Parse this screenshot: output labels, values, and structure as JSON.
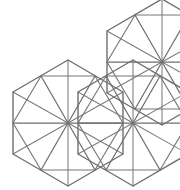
{
  "figure": {
    "type": "geometric-line-diagram",
    "canvas": {
      "width": 180,
      "height": 190,
      "background": "#ffffff"
    },
    "stroke_colors": {
      "outline": "#6f6f6f",
      "inner_ring": "#777777",
      "spoke": "#6f6f6f",
      "diagonal": "#7c7c7c"
    },
    "geometry": {
      "cell_shape": "hexagon",
      "cell_circumradius": 63,
      "hub_spokes": 12,
      "orientation": "pointy-top",
      "cells": [
        {
          "name": "cell-lower-left",
          "hub": [
            68,
            123
          ],
          "clipped": false
        },
        {
          "name": "cell-middle",
          "hub": [
            133,
            123
          ],
          "clipped": true
        },
        {
          "name": "cell-upper-right",
          "hub": [
            162,
            62
          ],
          "clipped": true
        }
      ],
      "cell_outline_vertices": [
        [
          0,
          -63
        ],
        [
          55,
          -31
        ],
        [
          55,
          31
        ],
        [
          0,
          63
        ],
        [
          -55,
          31
        ],
        [
          -55,
          -31
        ]
      ],
      "inner_ring_vertices": [
        [
          27,
          -47
        ],
        [
          55,
          0
        ],
        [
          27,
          47
        ],
        [
          -27,
          47
        ],
        [
          -55,
          0
        ],
        [
          -27,
          -47
        ]
      ]
    }
  }
}
